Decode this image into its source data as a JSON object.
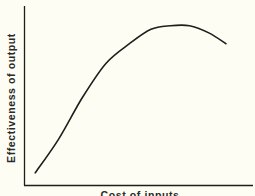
{
  "chart_data": {
    "type": "line",
    "title": "",
    "xlabel": "Cost of inputs",
    "ylabel": "Effectiveness of output",
    "grid": false,
    "legend": null,
    "x_ticks": [],
    "y_ticks": [],
    "series": [
      {
        "name": "Effectiveness vs cost",
        "note": "Qualitative inverted-U curve; values are normalized (0-1) estimates read from pixel positions",
        "x": [
          0.05,
          0.16,
          0.27,
          0.38,
          0.49,
          0.59,
          0.68,
          0.77,
          0.86,
          0.94
        ],
        "y": [
          0.07,
          0.26,
          0.49,
          0.68,
          0.79,
          0.87,
          0.89,
          0.89,
          0.85,
          0.79
        ]
      }
    ],
    "xlim": [
      0,
      1
    ],
    "ylim": [
      0,
      1
    ]
  },
  "colors": {
    "background": "#fdfdf3",
    "ink": "#1e1e1e"
  }
}
